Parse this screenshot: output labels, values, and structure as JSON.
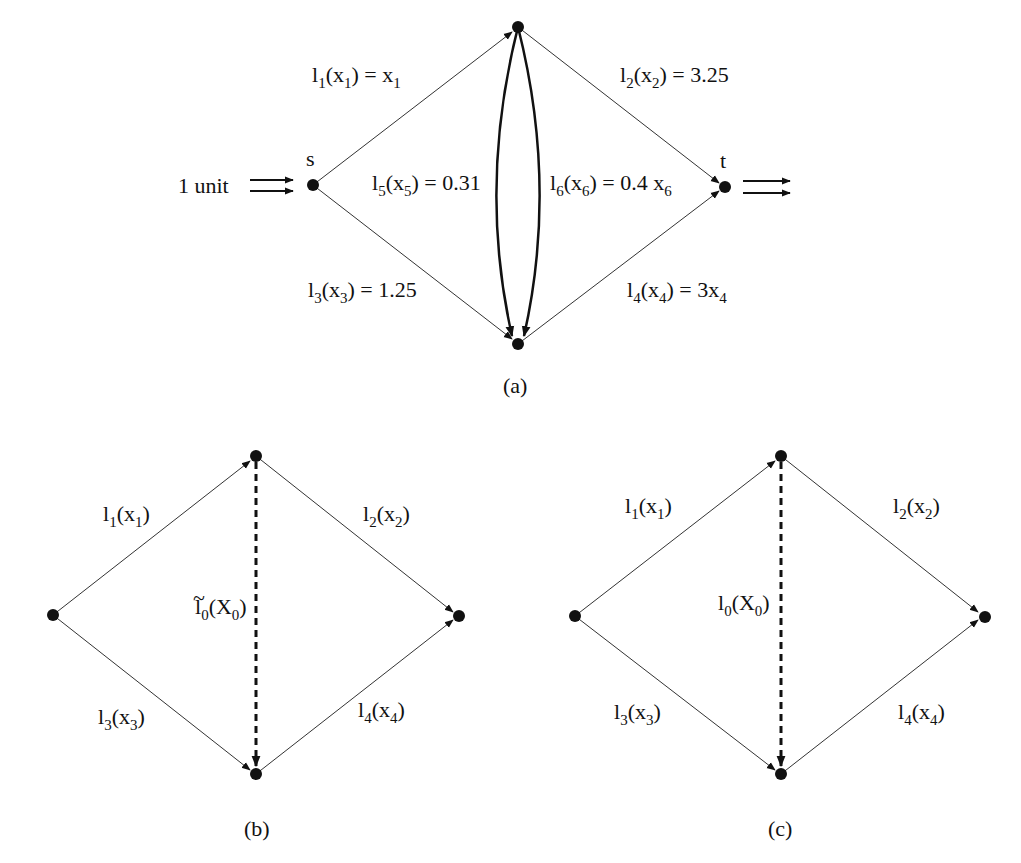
{
  "figure": {
    "panels": [
      {
        "id": "a",
        "caption": "(a)",
        "input_label": "1 unit",
        "nodes": [
          {
            "name": "s",
            "label": "s",
            "x": 313,
            "y": 185
          },
          {
            "name": "top",
            "label": "",
            "x": 518,
            "y": 27
          },
          {
            "name": "bottom",
            "label": "",
            "x": 518,
            "y": 344
          },
          {
            "name": "t",
            "label": "t",
            "x": 725,
            "y": 187
          }
        ],
        "edges": [
          {
            "id": "e1",
            "from": "s",
            "to": "top",
            "label": {
              "main": "l",
              "idx": "1",
              "arg": "x",
              "argidx": "1",
              "rhs": "= x",
              "rhsidx": "1"
            }
          },
          {
            "id": "e2",
            "from": "top",
            "to": "t",
            "label": {
              "main": "l",
              "idx": "2",
              "arg": "x",
              "argidx": "2",
              "rhs": "= 3.25",
              "rhsidx": ""
            }
          },
          {
            "id": "e3",
            "from": "s",
            "to": "bottom",
            "label": {
              "main": "l",
              "idx": "3",
              "arg": "x",
              "argidx": "3",
              "rhs": "= 1.25",
              "rhsidx": ""
            }
          },
          {
            "id": "e4",
            "from": "bottom",
            "to": "t",
            "label": {
              "main": "l",
              "idx": "4",
              "arg": "x",
              "argidx": "4",
              "rhs": "= 3x",
              "rhsidx": "4"
            }
          },
          {
            "id": "e5",
            "from": "top",
            "to": "bottom",
            "curved": "left",
            "label": {
              "main": "l",
              "idx": "5",
              "arg": "x",
              "argidx": "5",
              "rhs": "= 0.31",
              "rhsidx": ""
            }
          },
          {
            "id": "e6",
            "from": "top",
            "to": "bottom",
            "curved": "right",
            "label": {
              "main": "l",
              "idx": "6",
              "arg": "x",
              "argidx": "6",
              "rhs": "= 0.4 x",
              "rhsidx": "6"
            }
          }
        ]
      },
      {
        "id": "b",
        "caption": "(b)",
        "edges": [
          {
            "id": "e1",
            "label": {
              "main": "l",
              "idx": "1",
              "arg": "x",
              "argidx": "1"
            }
          },
          {
            "id": "e2",
            "label": {
              "main": "l",
              "idx": "2",
              "arg": "x",
              "argidx": "2"
            }
          },
          {
            "id": "e3",
            "label": {
              "main": "l",
              "idx": "3",
              "arg": "x",
              "argidx": "3"
            }
          },
          {
            "id": "e4",
            "label": {
              "main": "l",
              "idx": "4",
              "arg": "x",
              "argidx": "4"
            }
          },
          {
            "id": "e0",
            "dashed": true,
            "label": {
              "main": "l",
              "tilde": "~",
              "idx": "0",
              "arg": "X",
              "argidx": "0"
            }
          }
        ]
      },
      {
        "id": "c",
        "caption": "(c)",
        "edges": [
          {
            "id": "e1",
            "label": {
              "main": "l",
              "idx": "1",
              "arg": "x",
              "argidx": "1"
            }
          },
          {
            "id": "e2",
            "label": {
              "main": "l",
              "idx": "2",
              "arg": "x",
              "argidx": "2"
            }
          },
          {
            "id": "e3",
            "label": {
              "main": "l",
              "idx": "3",
              "arg": "x",
              "argidx": "3"
            }
          },
          {
            "id": "e4",
            "label": {
              "main": "l",
              "idx": "4",
              "arg": "x",
              "argidx": "4"
            }
          },
          {
            "id": "e0",
            "dashed": true,
            "label": {
              "main": "l",
              "idx": "0",
              "arg": "X",
              "argidx": "0"
            }
          }
        ]
      }
    ],
    "colors": {
      "ink": "#111111",
      "background": "#ffffff"
    }
  }
}
